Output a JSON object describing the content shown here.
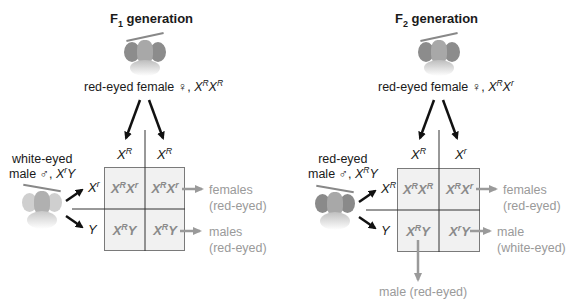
{
  "panels": [
    {
      "title_main": "F",
      "title_sub": "1",
      "title_rest": " generation",
      "female": {
        "label": "red-eyed female ♀, ",
        "genotype_a": "X",
        "sup_a": "R",
        "genotype_b": "X",
        "sup_b": "R"
      },
      "male": {
        "line1": "white-eyed",
        "line2": "male ♂, ",
        "genotype_a": "X",
        "sup_a": "r",
        "genotype_b": "Y"
      },
      "female_gametes": [
        {
          "base": "X",
          "sup": "R"
        },
        {
          "base": "X",
          "sup": "R"
        }
      ],
      "male_gametes": [
        {
          "base": "X",
          "sup": "r"
        },
        {
          "base": "Y",
          "sup": ""
        }
      ],
      "cells": [
        [
          {
            "a": "X",
            "as": "R",
            "b": "X",
            "bs": "r"
          },
          {
            "a": "X",
            "as": "R",
            "b": "X",
            "bs": "r"
          }
        ],
        [
          {
            "a": "X",
            "as": "R",
            "b": "Y",
            "bs": ""
          },
          {
            "a": "X",
            "as": "R",
            "b": "Y",
            "bs": ""
          }
        ]
      ],
      "results": [
        {
          "line1": "females",
          "line2": "(red-eyed)"
        },
        {
          "line1": "males",
          "line2": "(red-eyed)"
        }
      ]
    },
    {
      "title_main": "F",
      "title_sub": "2",
      "title_rest": " generation",
      "female": {
        "label": "red-eyed female ♀, ",
        "genotype_a": "X",
        "sup_a": "R",
        "genotype_b": "X",
        "sup_b": "r"
      },
      "male": {
        "line1": "red-eyed",
        "line2": "male ♂, ",
        "genotype_a": "X",
        "sup_a": "R",
        "genotype_b": "Y"
      },
      "female_gametes": [
        {
          "base": "X",
          "sup": "R"
        },
        {
          "base": "X",
          "sup": "r"
        }
      ],
      "male_gametes": [
        {
          "base": "X",
          "sup": "R"
        },
        {
          "base": "Y",
          "sup": ""
        }
      ],
      "cells": [
        [
          {
            "a": "X",
            "as": "R",
            "b": "X",
            "bs": "R"
          },
          {
            "a": "X",
            "as": "R",
            "b": "X",
            "bs": "r"
          }
        ],
        [
          {
            "a": "X",
            "as": "R",
            "b": "Y",
            "bs": ""
          },
          {
            "a": "X",
            "as": "r",
            "b": "Y",
            "bs": ""
          }
        ]
      ],
      "results": [
        {
          "line1": "females",
          "line2": "(red-eyed)"
        },
        {
          "line1": "male",
          "line2": "(white-eyed)"
        },
        {
          "line1": "male (red-eyed)",
          "line2": ""
        }
      ]
    }
  ],
  "colors": {
    "cell_bg": "#f1f1f1",
    "cell_text": "#8a8a8a",
    "result_text": "#9a9a9a",
    "arrow_gray": "#9a9a9a"
  }
}
